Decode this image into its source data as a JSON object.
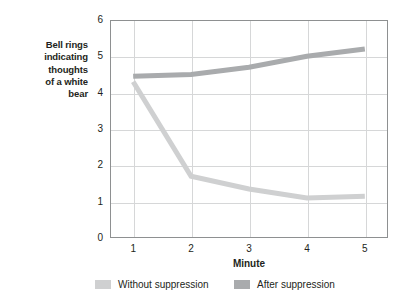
{
  "chart_data": {
    "type": "line",
    "title": "",
    "xlabel": "Minute",
    "ylabel": "Bell rings indicating thoughts of a white bear",
    "ylabel_lines": [
      "Bell rings",
      "indicating",
      "thoughts",
      "of a white",
      "bear"
    ],
    "x": [
      1,
      2,
      3,
      4,
      5
    ],
    "xticklabels": [
      "1",
      "2",
      "3",
      "4",
      "5"
    ],
    "yticklabels": [
      "0",
      "1",
      "2",
      "3",
      "4",
      "5",
      "6"
    ],
    "yticks": [
      0,
      1,
      2,
      3,
      4,
      5,
      6
    ],
    "xlim": [
      0.6,
      5.4
    ],
    "ylim": [
      0,
      6
    ],
    "grid": "horizontal-and-vertical",
    "legend_position": "bottom",
    "series": [
      {
        "name": "Without suppression",
        "color": "#cfd0d1",
        "values": [
          4.3,
          1.7,
          1.35,
          1.1,
          1.15
        ]
      },
      {
        "name": "After suppression",
        "color": "#a9abad",
        "values": [
          4.45,
          4.5,
          4.7,
          5.0,
          5.2
        ]
      }
    ]
  },
  "legend": {
    "entries": [
      {
        "label": "Without suppression",
        "color": "#cfd0d1"
      },
      {
        "label": "After suppression",
        "color": "#a9abad"
      }
    ]
  },
  "axis": {
    "x_title": "Minute",
    "y_title_lines": [
      "Bell rings",
      "indicating",
      "thoughts",
      "of a white",
      "bear"
    ]
  },
  "colors": {
    "axis_line": "#8e9091",
    "gridline": "#d6d7d8",
    "text": "#231f20",
    "background": "#ffffff"
  }
}
